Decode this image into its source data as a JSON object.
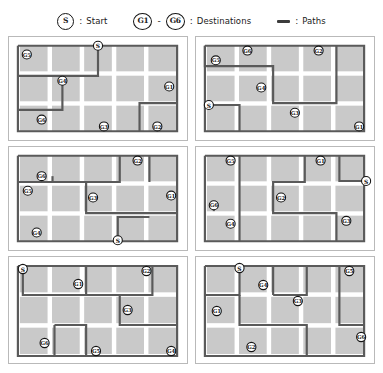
{
  "legend": {
    "start": {
      "marker": "S",
      "separator": ":",
      "label": "Start"
    },
    "destinations": {
      "marker_first": "G1",
      "range_dash": "-",
      "marker_last": "G6",
      "separator": ":",
      "label": "Destinations"
    },
    "paths": {
      "marker": "path-line",
      "separator": ":",
      "label": "Paths"
    }
  },
  "colors": {
    "cell": "#c9c9c9",
    "path": "#5a5a5a",
    "node_stroke": "#141414",
    "node_fill": "#ffffff",
    "panel_border": "#b9b9b9",
    "background": "#ffffff"
  },
  "grid": {
    "columns": 5,
    "rows": 3,
    "panel_count": 6,
    "panel_layout": "2 columns x 3 rows"
  },
  "panels": [
    {
      "id": "panel-1",
      "nodes": [
        {
          "label": "G5",
          "x": 18,
          "y": 18
        },
        {
          "label": "S",
          "x": 90,
          "y": 9
        },
        {
          "label": "G4",
          "x": 54,
          "y": 45
        },
        {
          "label": "G1",
          "x": 162,
          "y": 51
        },
        {
          "label": "G6",
          "x": 33,
          "y": 85
        },
        {
          "label": "G3",
          "x": 96,
          "y": 92
        },
        {
          "label": "G2",
          "x": 150,
          "y": 92
        }
      ],
      "paths": [
        "M 9 9 L 9 97 L 170 97 L 170 9 L 9 9",
        "M 90 9 L 90 40 L 9 40",
        "M 54 40 L 54 75 L 9 75",
        "M 170 68 L 132 68 L 132 97"
      ]
    },
    {
      "id": "panel-2",
      "nodes": [
        {
          "label": "G5",
          "x": 20,
          "y": 24
        },
        {
          "label": "G6",
          "x": 52,
          "y": 14
        },
        {
          "label": "G2",
          "x": 124,
          "y": 14
        },
        {
          "label": "G4",
          "x": 66,
          "y": 52
        },
        {
          "label": "G3",
          "x": 100,
          "y": 78
        },
        {
          "label": "S",
          "x": 13,
          "y": 70
        },
        {
          "label": "G1",
          "x": 165,
          "y": 92
        }
      ],
      "paths": [
        "M 9 9 L 9 97 L 170 97 L 170 9 L 9 9",
        "M 9 9 L 9 30 L 78 30 L 78 68 L 142 68 L 142 9",
        "M 13 70 L 44 70 L 44 97"
      ]
    },
    {
      "id": "panel-3",
      "nodes": [
        {
          "label": "G6",
          "x": 33,
          "y": 30
        },
        {
          "label": "G2",
          "x": 130,
          "y": 14
        },
        {
          "label": "G5",
          "x": 19,
          "y": 45
        },
        {
          "label": "G3",
          "x": 85,
          "y": 52
        },
        {
          "label": "G1",
          "x": 164,
          "y": 50
        },
        {
          "label": "G4",
          "x": 28,
          "y": 88
        },
        {
          "label": "S",
          "x": 110,
          "y": 96
        }
      ],
      "paths": [
        "M 9 9 L 9 97 L 170 97 L 170 9 L 9 9",
        "M 112 9 L 112 36 L 9 36",
        "M 44 36 L 44 30",
        "M 78 36 L 78 68 L 170 68",
        "M 110 96 L 110 72 L 142 72",
        "M 142 9 L 142 36"
      ]
    },
    {
      "id": "panel-4",
      "nodes": [
        {
          "label": "G5",
          "x": 35,
          "y": 14
        },
        {
          "label": "G1",
          "x": 126,
          "y": 14
        },
        {
          "label": "S",
          "x": 172,
          "y": 35
        },
        {
          "label": "G2",
          "x": 86,
          "y": 52
        },
        {
          "label": "G6",
          "x": 18,
          "y": 60
        },
        {
          "label": "G4",
          "x": 35,
          "y": 79
        },
        {
          "label": "G3",
          "x": 152,
          "y": 76
        }
      ],
      "paths": [
        "M 9 9 L 9 97 L 170 97 L 170 9 L 9 9",
        "M 172 35 L 145 35 L 145 9",
        "M 110 9 L 110 36 L 78 36 L 78 68 L 142 68 L 142 97",
        "M 44 9 L 44 97",
        "M 18 60 L 18 66"
      ]
    },
    {
      "id": "panel-5",
      "nodes": [
        {
          "label": "S",
          "x": 14,
          "y": 12
        },
        {
          "label": "G1",
          "x": 70,
          "y": 27
        },
        {
          "label": "G2",
          "x": 139,
          "y": 14
        },
        {
          "label": "G3",
          "x": 120,
          "y": 53
        },
        {
          "label": "G6",
          "x": 36,
          "y": 86
        },
        {
          "label": "G5",
          "x": 88,
          "y": 94
        },
        {
          "label": "G4",
          "x": 164,
          "y": 94
        }
      ],
      "paths": [
        "M 9 9 L 9 99 L 170 99 L 170 9 L 9 9",
        "M 14 12 L 14 38 L 78 38 L 78 9",
        "M 78 38 L 145 38 L 145 9",
        "M 112 38 L 112 68 L 170 68",
        "M 46 68 L 46 99",
        "M 46 68 L 78 68 L 78 99"
      ]
    },
    {
      "id": "panel-6",
      "nodes": [
        {
          "label": "S",
          "x": 44,
          "y": 11
        },
        {
          "label": "G4",
          "x": 68,
          "y": 28
        },
        {
          "label": "G5",
          "x": 155,
          "y": 14
        },
        {
          "label": "G3",
          "x": 103,
          "y": 44
        },
        {
          "label": "G1",
          "x": 21,
          "y": 54
        },
        {
          "label": "G2",
          "x": 56,
          "y": 90
        },
        {
          "label": "G6",
          "x": 167,
          "y": 80
        }
      ],
      "paths": [
        "M 9 9 L 9 99 L 170 99 L 170 9 L 9 9",
        "M 44 11 L 44 38 L 9 38",
        "M 78 38 L 78 9",
        "M 78 38 L 112 38 L 112 9",
        "M 145 9 L 145 68 L 170 68",
        "M 44 38 L 44 68 L 112 68 L 112 99"
      ]
    }
  ]
}
